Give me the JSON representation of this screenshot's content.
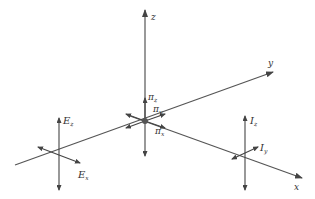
{
  "diagram": {
    "axes": {
      "z": "z",
      "y": "y",
      "x": "x"
    },
    "center": {
      "labels": {
        "pi_z": {
          "main": "π",
          "sub": "z"
        },
        "pi_y": {
          "main": "π",
          "sub": "y"
        },
        "pi_x": {
          "main": "π",
          "sub": "x"
        }
      }
    },
    "left_frame": {
      "labels": {
        "E_z": {
          "main": "E",
          "sub": "z"
        },
        "E_x": {
          "main": "E",
          "sub": "x"
        }
      }
    },
    "right_frame": {
      "labels": {
        "I_z": {
          "main": "I",
          "sub": "z"
        },
        "I_y": {
          "main": "I",
          "sub": "y"
        }
      }
    },
    "colors": {
      "line": "#555555",
      "text": "#333333",
      "background": "#ffffff"
    }
  }
}
